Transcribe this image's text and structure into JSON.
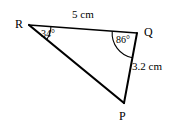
{
  "figure": {
    "type": "triangle-diagram",
    "background_color": "#ffffff",
    "stroke_color": "#000000",
    "vertices": [
      {
        "name": "R",
        "label": "R",
        "x": 29,
        "y": 25
      },
      {
        "name": "Q",
        "label": "Q",
        "x": 137,
        "y": 33
      },
      {
        "name": "P",
        "label": "P",
        "x": 124,
        "y": 103
      }
    ],
    "sides": [
      {
        "name": "RQ",
        "from": "R",
        "to": "Q",
        "label": "5 cm",
        "stroke_width": 1.5
      },
      {
        "name": "QP",
        "from": "Q",
        "to": "P",
        "label": "3.2 cm",
        "stroke_width": 2
      },
      {
        "name": "RP",
        "from": "R",
        "to": "P",
        "label": "",
        "stroke_width": 2.2
      }
    ],
    "angles": [
      {
        "name": "angle-R",
        "at": "R",
        "label": "34°",
        "value": 34,
        "arc_radius": 22
      },
      {
        "name": "angle-Q",
        "at": "Q",
        "label": "86°",
        "value": 86,
        "arc_radius": 25
      }
    ]
  }
}
